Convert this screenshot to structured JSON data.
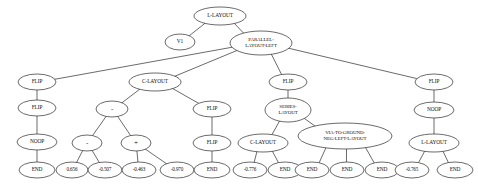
{
  "diagram": {
    "type": "tree",
    "background_color": "#ffffff",
    "node_fill_color": "#ffffff",
    "node_stroke_color": "#2b2b2b",
    "edge_color": "#2b2b2b",
    "node_count": 34,
    "nodes": [
      {
        "id": "n0",
        "label": "L-LAYOUT",
        "lines": [
          "L-LAYOUT"
        ],
        "x": 220,
        "y": 16,
        "rx": 26,
        "ry": 9,
        "kind": "one-line"
      },
      {
        "id": "n1",
        "label": "V1",
        "lines": [
          "V1"
        ],
        "x": 180,
        "y": 42,
        "rx": 15,
        "ry": 8,
        "kind": "one-line"
      },
      {
        "id": "n2",
        "label": "PARALLEL-LAYOUT-LEFT",
        "lines": [
          "PARALLEL-",
          "LAYOUT-LEFT"
        ],
        "x": 261,
        "y": 43,
        "rx": 31,
        "ry": 12,
        "kind": "two-line"
      },
      {
        "id": "n3",
        "label": "FLIP",
        "lines": [
          "FLIP"
        ],
        "x": 37,
        "y": 82,
        "rx": 19,
        "ry": 8,
        "kind": "one-line"
      },
      {
        "id": "n4",
        "label": "FLIP",
        "lines": [
          "FLIP"
        ],
        "x": 37,
        "y": 108,
        "rx": 19,
        "ry": 8,
        "kind": "one-line"
      },
      {
        "id": "n5",
        "label": "NOOP",
        "lines": [
          "NOOP"
        ],
        "x": 37,
        "y": 142,
        "rx": 20,
        "ry": 8,
        "kind": "one-line"
      },
      {
        "id": "n6",
        "label": "END",
        "lines": [
          "END"
        ],
        "x": 37,
        "y": 170,
        "rx": 18,
        "ry": 8,
        "kind": "one-line"
      },
      {
        "id": "n7",
        "label": "C-LAYOUT",
        "lines": [
          "C-LAYOUT"
        ],
        "x": 155,
        "y": 82,
        "rx": 26,
        "ry": 9,
        "kind": "one-line"
      },
      {
        "id": "n8",
        "label": "-",
        "lines": [
          "-"
        ],
        "x": 112,
        "y": 109,
        "rx": 16,
        "ry": 8,
        "kind": "op"
      },
      {
        "id": "n9",
        "label": "-",
        "lines": [
          "-"
        ],
        "x": 87,
        "y": 143,
        "rx": 15,
        "ry": 8,
        "kind": "op"
      },
      {
        "id": "n10",
        "label": "+",
        "lines": [
          "+"
        ],
        "x": 136,
        "y": 143,
        "rx": 15,
        "ry": 8,
        "kind": "op"
      },
      {
        "id": "n11",
        "label": "0.656",
        "lines": [
          "0.656"
        ],
        "x": 72,
        "y": 170,
        "rx": 16,
        "ry": 8,
        "kind": "num"
      },
      {
        "id": "n12",
        "label": "-0.507",
        "lines": [
          "-0.507"
        ],
        "x": 105,
        "y": 170,
        "rx": 17,
        "ry": 8,
        "kind": "num"
      },
      {
        "id": "n13",
        "label": "-0.463",
        "lines": [
          "-0.463"
        ],
        "x": 139,
        "y": 170,
        "rx": 17,
        "ry": 8,
        "kind": "num"
      },
      {
        "id": "n14",
        "label": "-0.970",
        "lines": [
          "-0.970"
        ],
        "x": 177,
        "y": 170,
        "rx": 17,
        "ry": 8,
        "kind": "num"
      },
      {
        "id": "n15",
        "label": "FLIP",
        "lines": [
          "FLIP"
        ],
        "x": 212,
        "y": 109,
        "rx": 19,
        "ry": 8,
        "kind": "one-line"
      },
      {
        "id": "n16",
        "label": "FLIP",
        "lines": [
          "FLIP"
        ],
        "x": 212,
        "y": 143,
        "rx": 19,
        "ry": 8,
        "kind": "one-line"
      },
      {
        "id": "n17",
        "label": "END",
        "lines": [
          "END"
        ],
        "x": 212,
        "y": 170,
        "rx": 18,
        "ry": 8,
        "kind": "one-line"
      },
      {
        "id": "n18",
        "label": "FLIP",
        "lines": [
          "FLIP"
        ],
        "x": 288,
        "y": 82,
        "rx": 19,
        "ry": 8,
        "kind": "one-line"
      },
      {
        "id": "n19",
        "label": "SERIES-LAYOUT",
        "lines": [
          "SERIES-",
          "LAYOUT"
        ],
        "x": 288,
        "y": 110,
        "rx": 23,
        "ry": 12,
        "kind": "two-line"
      },
      {
        "id": "n20",
        "label": "C-LAYOUT",
        "lines": [
          "C-LAYOUT"
        ],
        "x": 263,
        "y": 143,
        "rx": 25,
        "ry": 9,
        "kind": "one-line"
      },
      {
        "id": "n21",
        "label": "-0.776",
        "lines": [
          "-0.776"
        ],
        "x": 250,
        "y": 170,
        "rx": 17,
        "ry": 8,
        "kind": "num"
      },
      {
        "id": "n22",
        "label": "END",
        "lines": [
          "END"
        ],
        "x": 285,
        "y": 170,
        "rx": 17,
        "ry": 8,
        "kind": "one-line"
      },
      {
        "id": "n23",
        "label": "VIA-TO-GROUND-NEG-LEFT-LAYOUT",
        "lines": [
          "VIA-TO-GROUND-",
          "NEG-LEFT-LAYOUT"
        ],
        "x": 345,
        "y": 136,
        "rx": 47,
        "ry": 13,
        "kind": "two-line"
      },
      {
        "id": "n24",
        "label": "END",
        "lines": [
          "END"
        ],
        "x": 312,
        "y": 170,
        "rx": 17,
        "ry": 8,
        "kind": "one-line"
      },
      {
        "id": "n25",
        "label": "END",
        "lines": [
          "END"
        ],
        "x": 347,
        "y": 170,
        "rx": 17,
        "ry": 8,
        "kind": "one-line"
      },
      {
        "id": "n26",
        "label": "END",
        "lines": [
          "END"
        ],
        "x": 382,
        "y": 170,
        "rx": 17,
        "ry": 8,
        "kind": "one-line"
      },
      {
        "id": "n27",
        "label": "FLIP",
        "lines": [
          "FLIP"
        ],
        "x": 434,
        "y": 82,
        "rx": 19,
        "ry": 8,
        "kind": "one-line"
      },
      {
        "id": "n28",
        "label": "NOOP",
        "lines": [
          "NOOP"
        ],
        "x": 434,
        "y": 110,
        "rx": 20,
        "ry": 8,
        "kind": "one-line"
      },
      {
        "id": "n29",
        "label": "L-LAYOUT",
        "lines": [
          "L-LAYOUT"
        ],
        "x": 434,
        "y": 143,
        "rx": 25,
        "ry": 9,
        "kind": "one-line"
      },
      {
        "id": "n30",
        "label": "-0.765",
        "lines": [
          "-0.765"
        ],
        "x": 412,
        "y": 170,
        "rx": 17,
        "ry": 8,
        "kind": "num"
      },
      {
        "id": "n31",
        "label": "END",
        "lines": [
          "END"
        ],
        "x": 455,
        "y": 170,
        "rx": 18,
        "ry": 8,
        "kind": "one-line"
      }
    ],
    "edges": [
      {
        "from": "n0",
        "to": "n1"
      },
      {
        "from": "n0",
        "to": "n2"
      },
      {
        "from": "n2",
        "to": "n3"
      },
      {
        "from": "n2",
        "to": "n7"
      },
      {
        "from": "n2",
        "to": "n18"
      },
      {
        "from": "n2",
        "to": "n27"
      },
      {
        "from": "n3",
        "to": "n4"
      },
      {
        "from": "n4",
        "to": "n5"
      },
      {
        "from": "n5",
        "to": "n6"
      },
      {
        "from": "n7",
        "to": "n8"
      },
      {
        "from": "n7",
        "to": "n15"
      },
      {
        "from": "n8",
        "to": "n9"
      },
      {
        "from": "n8",
        "to": "n10"
      },
      {
        "from": "n9",
        "to": "n11"
      },
      {
        "from": "n9",
        "to": "n12"
      },
      {
        "from": "n10",
        "to": "n13"
      },
      {
        "from": "n10",
        "to": "n14"
      },
      {
        "from": "n15",
        "to": "n16"
      },
      {
        "from": "n16",
        "to": "n17"
      },
      {
        "from": "n18",
        "to": "n19"
      },
      {
        "from": "n19",
        "to": "n20"
      },
      {
        "from": "n19",
        "to": "n23"
      },
      {
        "from": "n20",
        "to": "n21"
      },
      {
        "from": "n20",
        "to": "n22"
      },
      {
        "from": "n23",
        "to": "n24"
      },
      {
        "from": "n23",
        "to": "n25"
      },
      {
        "from": "n23",
        "to": "n26"
      },
      {
        "from": "n27",
        "to": "n28"
      },
      {
        "from": "n28",
        "to": "n29"
      },
      {
        "from": "n29",
        "to": "n30"
      },
      {
        "from": "n29",
        "to": "n31"
      }
    ]
  }
}
